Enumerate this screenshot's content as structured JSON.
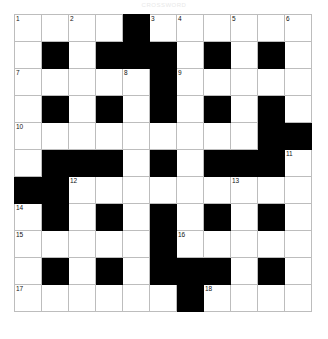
{
  "title": "CROSSWORD",
  "colors": {
    "block": "#000000",
    "cell": "#ffffff",
    "gridline": "#bdbdbd",
    "number": "#111111",
    "title": "#e8e8e8"
  },
  "grid": {
    "rows": 11,
    "cols": 11,
    "cell_size_px": 27,
    "cells": [
      [
        {
          "type": "open",
          "number": "1",
          "letter": ""
        },
        {
          "type": "open",
          "number": "",
          "letter": ""
        },
        {
          "type": "open",
          "number": "2",
          "letter": ""
        },
        {
          "type": "open",
          "number": "",
          "letter": ""
        },
        {
          "type": "block",
          "number": "",
          "letter": ""
        },
        {
          "type": "open",
          "number": "3",
          "letter": ""
        },
        {
          "type": "open",
          "number": "4",
          "letter": ""
        },
        {
          "type": "open",
          "number": "",
          "letter": ""
        },
        {
          "type": "open",
          "number": "5",
          "letter": ""
        },
        {
          "type": "open",
          "number": "",
          "letter": ""
        },
        {
          "type": "open",
          "number": "6",
          "letter": ""
        }
      ],
      [
        {
          "type": "open",
          "number": "",
          "letter": ""
        },
        {
          "type": "block",
          "number": "",
          "letter": ""
        },
        {
          "type": "open",
          "number": "",
          "letter": ""
        },
        {
          "type": "block",
          "number": "",
          "letter": ""
        },
        {
          "type": "block",
          "number": "",
          "letter": ""
        },
        {
          "type": "block",
          "number": "",
          "letter": ""
        },
        {
          "type": "open",
          "number": "",
          "letter": ""
        },
        {
          "type": "block",
          "number": "",
          "letter": ""
        },
        {
          "type": "open",
          "number": "",
          "letter": ""
        },
        {
          "type": "block",
          "number": "",
          "letter": ""
        },
        {
          "type": "open",
          "number": "",
          "letter": ""
        }
      ],
      [
        {
          "type": "open",
          "number": "7",
          "letter": ""
        },
        {
          "type": "open",
          "number": "",
          "letter": ""
        },
        {
          "type": "open",
          "number": "",
          "letter": ""
        },
        {
          "type": "open",
          "number": "",
          "letter": ""
        },
        {
          "type": "open",
          "number": "8",
          "letter": ""
        },
        {
          "type": "block",
          "number": "",
          "letter": ""
        },
        {
          "type": "open",
          "number": "9",
          "letter": ""
        },
        {
          "type": "open",
          "number": "",
          "letter": ""
        },
        {
          "type": "open",
          "number": "",
          "letter": ""
        },
        {
          "type": "open",
          "number": "",
          "letter": ""
        },
        {
          "type": "open",
          "number": "",
          "letter": ""
        }
      ],
      [
        {
          "type": "open",
          "number": "",
          "letter": ""
        },
        {
          "type": "block",
          "number": "",
          "letter": ""
        },
        {
          "type": "open",
          "number": "",
          "letter": ""
        },
        {
          "type": "block",
          "number": "",
          "letter": ""
        },
        {
          "type": "open",
          "number": "",
          "letter": ""
        },
        {
          "type": "block",
          "number": "",
          "letter": ""
        },
        {
          "type": "open",
          "number": "",
          "letter": ""
        },
        {
          "type": "block",
          "number": "",
          "letter": ""
        },
        {
          "type": "open",
          "number": "",
          "letter": ""
        },
        {
          "type": "block",
          "number": "",
          "letter": ""
        },
        {
          "type": "open",
          "number": "",
          "letter": ""
        }
      ],
      [
        {
          "type": "open",
          "number": "10",
          "letter": ""
        },
        {
          "type": "open",
          "number": "",
          "letter": ""
        },
        {
          "type": "open",
          "number": "",
          "letter": ""
        },
        {
          "type": "open",
          "number": "",
          "letter": ""
        },
        {
          "type": "open",
          "number": "",
          "letter": ""
        },
        {
          "type": "open",
          "number": "",
          "letter": ""
        },
        {
          "type": "open",
          "number": "",
          "letter": ""
        },
        {
          "type": "open",
          "number": "",
          "letter": ""
        },
        {
          "type": "open",
          "number": "",
          "letter": ""
        },
        {
          "type": "block",
          "number": "",
          "letter": ""
        },
        {
          "type": "block",
          "number": "",
          "letter": ""
        }
      ],
      [
        {
          "type": "open",
          "number": "",
          "letter": ""
        },
        {
          "type": "block",
          "number": "",
          "letter": ""
        },
        {
          "type": "block",
          "number": "",
          "letter": ""
        },
        {
          "type": "block",
          "number": "",
          "letter": ""
        },
        {
          "type": "open",
          "number": "",
          "letter": ""
        },
        {
          "type": "block",
          "number": "",
          "letter": ""
        },
        {
          "type": "open",
          "number": "",
          "letter": ""
        },
        {
          "type": "block",
          "number": "",
          "letter": ""
        },
        {
          "type": "block",
          "number": "",
          "letter": ""
        },
        {
          "type": "block",
          "number": "",
          "letter": ""
        },
        {
          "type": "open",
          "number": "11",
          "letter": ""
        }
      ],
      [
        {
          "type": "block",
          "number": "",
          "letter": ""
        },
        {
          "type": "block",
          "number": "",
          "letter": ""
        },
        {
          "type": "open",
          "number": "12",
          "letter": ""
        },
        {
          "type": "open",
          "number": "",
          "letter": ""
        },
        {
          "type": "open",
          "number": "",
          "letter": ""
        },
        {
          "type": "open",
          "number": "",
          "letter": ""
        },
        {
          "type": "open",
          "number": "",
          "letter": ""
        },
        {
          "type": "open",
          "number": "",
          "letter": ""
        },
        {
          "type": "open",
          "number": "13",
          "letter": ""
        },
        {
          "type": "open",
          "number": "",
          "letter": ""
        },
        {
          "type": "open",
          "number": "",
          "letter": ""
        }
      ],
      [
        {
          "type": "open",
          "number": "14",
          "letter": ""
        },
        {
          "type": "block",
          "number": "",
          "letter": ""
        },
        {
          "type": "open",
          "number": "",
          "letter": ""
        },
        {
          "type": "block",
          "number": "",
          "letter": ""
        },
        {
          "type": "open",
          "number": "",
          "letter": ""
        },
        {
          "type": "block",
          "number": "",
          "letter": ""
        },
        {
          "type": "open",
          "number": "",
          "letter": ""
        },
        {
          "type": "block",
          "number": "",
          "letter": ""
        },
        {
          "type": "open",
          "number": "",
          "letter": ""
        },
        {
          "type": "block",
          "number": "",
          "letter": ""
        },
        {
          "type": "open",
          "number": "",
          "letter": ""
        }
      ],
      [
        {
          "type": "open",
          "number": "15",
          "letter": ""
        },
        {
          "type": "open",
          "number": "",
          "letter": ""
        },
        {
          "type": "open",
          "number": "",
          "letter": ""
        },
        {
          "type": "open",
          "number": "",
          "letter": ""
        },
        {
          "type": "open",
          "number": "",
          "letter": ""
        },
        {
          "type": "block",
          "number": "",
          "letter": ""
        },
        {
          "type": "open",
          "number": "16",
          "letter": ""
        },
        {
          "type": "open",
          "number": "",
          "letter": ""
        },
        {
          "type": "open",
          "number": "",
          "letter": ""
        },
        {
          "type": "open",
          "number": "",
          "letter": ""
        },
        {
          "type": "open",
          "number": "",
          "letter": ""
        }
      ],
      [
        {
          "type": "open",
          "number": "",
          "letter": ""
        },
        {
          "type": "block",
          "number": "",
          "letter": ""
        },
        {
          "type": "open",
          "number": "",
          "letter": ""
        },
        {
          "type": "block",
          "number": "",
          "letter": ""
        },
        {
          "type": "open",
          "number": "",
          "letter": ""
        },
        {
          "type": "block",
          "number": "",
          "letter": ""
        },
        {
          "type": "block",
          "number": "",
          "letter": ""
        },
        {
          "type": "block",
          "number": "",
          "letter": ""
        },
        {
          "type": "open",
          "number": "",
          "letter": ""
        },
        {
          "type": "block",
          "number": "",
          "letter": ""
        },
        {
          "type": "open",
          "number": "",
          "letter": ""
        }
      ],
      [
        {
          "type": "open",
          "number": "17",
          "letter": ""
        },
        {
          "type": "open",
          "number": "",
          "letter": ""
        },
        {
          "type": "open",
          "number": "",
          "letter": ""
        },
        {
          "type": "open",
          "number": "",
          "letter": ""
        },
        {
          "type": "open",
          "number": "",
          "letter": ""
        },
        {
          "type": "open",
          "number": "",
          "letter": ""
        },
        {
          "type": "block",
          "number": "",
          "letter": ""
        },
        {
          "type": "open",
          "number": "18",
          "letter": ""
        },
        {
          "type": "open",
          "number": "",
          "letter": ""
        },
        {
          "type": "open",
          "number": "",
          "letter": ""
        },
        {
          "type": "open",
          "number": "",
          "letter": ""
        }
      ]
    ]
  }
}
